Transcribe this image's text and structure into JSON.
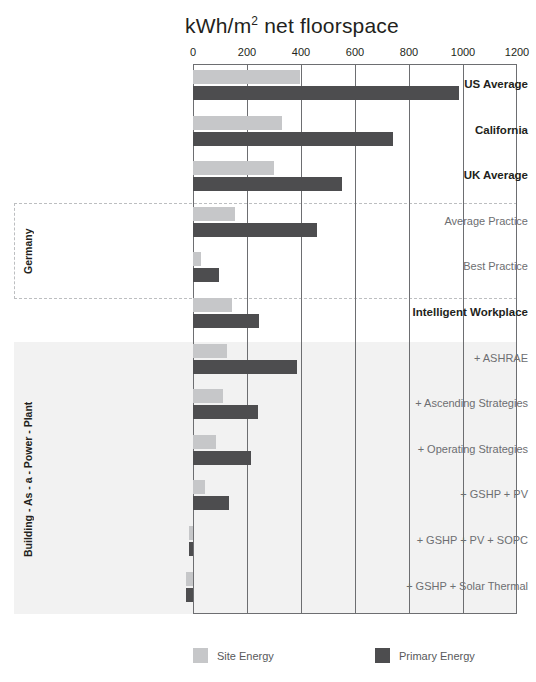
{
  "chart_data": {
    "type": "bar",
    "orientation": "horizontal",
    "title_main": "kWh/m",
    "title_sup": "2",
    "title_tail": " net floorspace",
    "xlabel": "",
    "ylabel": "",
    "xlim": [
      0,
      1200
    ],
    "ticks": [
      0,
      200,
      400,
      600,
      800,
      1000,
      1200
    ],
    "tick_labels": [
      "0",
      "200",
      "400",
      "600",
      "800",
      "1000",
      "1200"
    ],
    "grid": true,
    "legend_position": "bottom",
    "categories": [
      "US Average",
      "California",
      "UK Average",
      "Average Practice",
      "Best Practice",
      "Intelligent Workplace",
      "+ ASHRAE",
      "+ Ascending Strategies",
      "+ Operating Strategies",
      "+ GSHP + PV",
      "+ GSHP + PV + SOPC",
      "+ GSHP + Solar Thermal"
    ],
    "series": [
      {
        "name": "Site Energy",
        "color": "#c6c7c9",
        "values": [
          395,
          330,
          300,
          155,
          28,
          145,
          125,
          110,
          85,
          45,
          -16,
          -26
        ]
      },
      {
        "name": "Primary Energy",
        "color": "#4d4d4f",
        "values": [
          985,
          740,
          550,
          460,
          95,
          245,
          385,
          240,
          215,
          135,
          -16,
          -26
        ]
      }
    ],
    "groups": [
      {
        "label": "Germany",
        "categories": [
          "Average Practice",
          "Best Practice"
        ],
        "style": "dashed-box"
      },
      {
        "label": "Building - As - a - Power - Plant",
        "categories": [
          "+ ASHRAE",
          "+ Ascending Strategies",
          "+ Operating Strategies",
          "+ GSHP + PV",
          "+ GSHP + PV + SOPC",
          "+ GSHP + Solar Thermal"
        ],
        "style": "shaded-band"
      }
    ],
    "bold_categories": [
      "US Average",
      "California",
      "UK Average",
      "Intelligent Workplace"
    ],
    "colors": {
      "site_energy": "#c6c7c9",
      "primary_energy": "#4d4d4f",
      "axis": "#6d6e71",
      "band_shade": "#f2f2f2",
      "dash_border": "#bcbec0",
      "text": "#231f20",
      "muted_text": "#6d6e71"
    }
  },
  "legend": {
    "items": [
      {
        "label": "Site Energy",
        "swatch": "site"
      },
      {
        "label": "Primary Energy",
        "swatch": "primary"
      }
    ]
  },
  "group_labels": {
    "germany": "Germany",
    "bapp": "Building - As - a - Power - Plant"
  }
}
